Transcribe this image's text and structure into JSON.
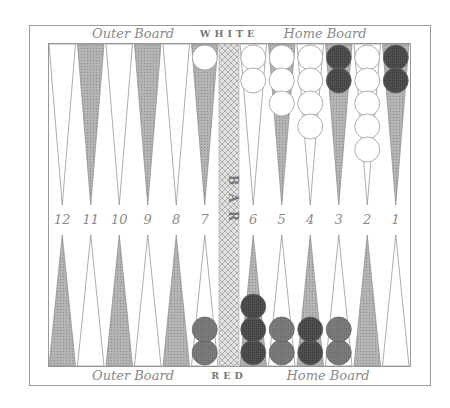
{
  "board": {
    "top_left_label": "Outer Board",
    "top_center_label": "WHITE",
    "top_right_label": "Home Board",
    "bottom_left_label": "Outer Board",
    "bottom_center_label": "RED",
    "bottom_right_label": "Home Board",
    "bar_label": "BAR",
    "colors": {
      "frame": "#9a9a9a",
      "light_point": "#ffffff",
      "dark_point": "#a8a8a8",
      "bar": "#d4d4d4",
      "white_checker": "#ffffff",
      "dark_red_checker": "#555555",
      "red_checker": "#7a7a7a",
      "number_text": "#8a8a8a",
      "label_text": "#888888"
    },
    "point_numbers_left": [
      "12",
      "11",
      "10",
      "9",
      "8",
      "7"
    ],
    "point_numbers_right": [
      "6",
      "5",
      "4",
      "3",
      "2",
      "1"
    ],
    "top_points": [
      {
        "number": "12",
        "shade": "light",
        "checkers": []
      },
      {
        "number": "11",
        "shade": "dark",
        "checkers": []
      },
      {
        "number": "10",
        "shade": "light",
        "checkers": []
      },
      {
        "number": "9",
        "shade": "dark",
        "checkers": []
      },
      {
        "number": "8",
        "shade": "light",
        "checkers": []
      },
      {
        "number": "7",
        "shade": "dark",
        "checkers": [
          "white"
        ]
      },
      {
        "number": "6",
        "shade": "light",
        "checkers": [
          "white",
          "white"
        ]
      },
      {
        "number": "5",
        "shade": "dark",
        "checkers": [
          "white",
          "white",
          "white"
        ]
      },
      {
        "number": "4",
        "shade": "light",
        "checkers": [
          "white",
          "white",
          "white",
          "white"
        ]
      },
      {
        "number": "3",
        "shade": "dark",
        "checkers": [
          "darkred",
          "darkred"
        ]
      },
      {
        "number": "2",
        "shade": "light",
        "checkers": [
          "white",
          "white",
          "white",
          "white",
          "white"
        ]
      },
      {
        "number": "1",
        "shade": "dark",
        "checkers": [
          "darkred",
          "darkred"
        ]
      }
    ],
    "bottom_points": [
      {
        "shade": "dark",
        "checkers": []
      },
      {
        "shade": "light",
        "checkers": []
      },
      {
        "shade": "dark",
        "checkers": []
      },
      {
        "shade": "light",
        "checkers": []
      },
      {
        "shade": "dark",
        "checkers": []
      },
      {
        "shade": "light",
        "checkers": [
          "red",
          "red"
        ]
      },
      {
        "shade": "dark",
        "checkers": [
          "darkred",
          "darkred",
          "darkred"
        ]
      },
      {
        "shade": "light",
        "checkers": [
          "red",
          "red"
        ]
      },
      {
        "shade": "dark",
        "checkers": [
          "darkred",
          "darkred"
        ]
      },
      {
        "shade": "light",
        "checkers": [
          "red",
          "red"
        ]
      },
      {
        "shade": "dark",
        "checkers": []
      },
      {
        "shade": "light",
        "checkers": []
      }
    ]
  }
}
